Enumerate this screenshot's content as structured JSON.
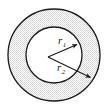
{
  "figure": {
    "name": "annulus-radii-diagram",
    "background_color": "#ffffff",
    "stroke_color": "#1a1a1a",
    "fill_color": "#e8e8e8",
    "inner_fill_color": "#ffffff"
  },
  "shapes": {
    "outer_circle": {
      "label": "outer-circle",
      "center_x": 54,
      "center_y": 55,
      "radius": 46,
      "stroke_width": 1.3
    },
    "inner_circle": {
      "label": "inner-circle",
      "center_x": 54,
      "center_y": 55,
      "radius": 28,
      "stroke_width": 1.3
    }
  },
  "annotations": {
    "center_point": {
      "x": 48,
      "y": 57
    },
    "radius_1": {
      "symbol": "r",
      "subscript": "1",
      "full_label": "r1",
      "label_x": 58,
      "label_y": 44,
      "arrow_from_x": 48,
      "arrow_from_y": 57,
      "arrow_to_x": 79,
      "arrow_to_y": 43
    },
    "radius_2": {
      "symbol": "r",
      "subscript": "2",
      "full_label": "r2",
      "label_x": 57,
      "label_y": 71,
      "arrow_from_x": 48,
      "arrow_from_y": 57,
      "arrow_to_x": 93,
      "arrow_to_y": 79
    }
  }
}
